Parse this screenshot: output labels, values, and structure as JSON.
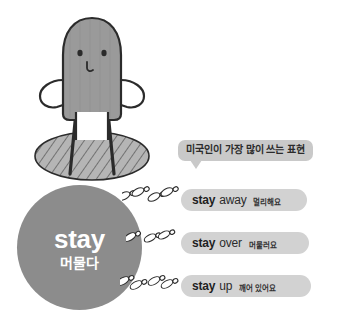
{
  "illustration": {
    "character_name": "blob-character",
    "ground_name": "hatched-ground-ellipse"
  },
  "word_circle": {
    "english": "stay",
    "korean": "머물다"
  },
  "bubble": {
    "text": "미국인이 가장 많이 쓰는 표현"
  },
  "phrases": [
    {
      "verb": "stay",
      "particle": "away",
      "korean": "멀리해요"
    },
    {
      "verb": "stay",
      "particle": "over",
      "korean": "머물러요"
    },
    {
      "verb": "stay",
      "particle": "up",
      "korean": "깨어 있어요"
    }
  ],
  "colors": {
    "background": "#ffffff",
    "circle_gray": "#8c8c8c",
    "pill_gray": "#d2d2d2",
    "bubble_gray": "#c9c9c9",
    "character_gray": "#9a9a9a",
    "outline": "#2b2b2b",
    "text_dark": "#1f1f1f",
    "text_white": "#ffffff"
  }
}
